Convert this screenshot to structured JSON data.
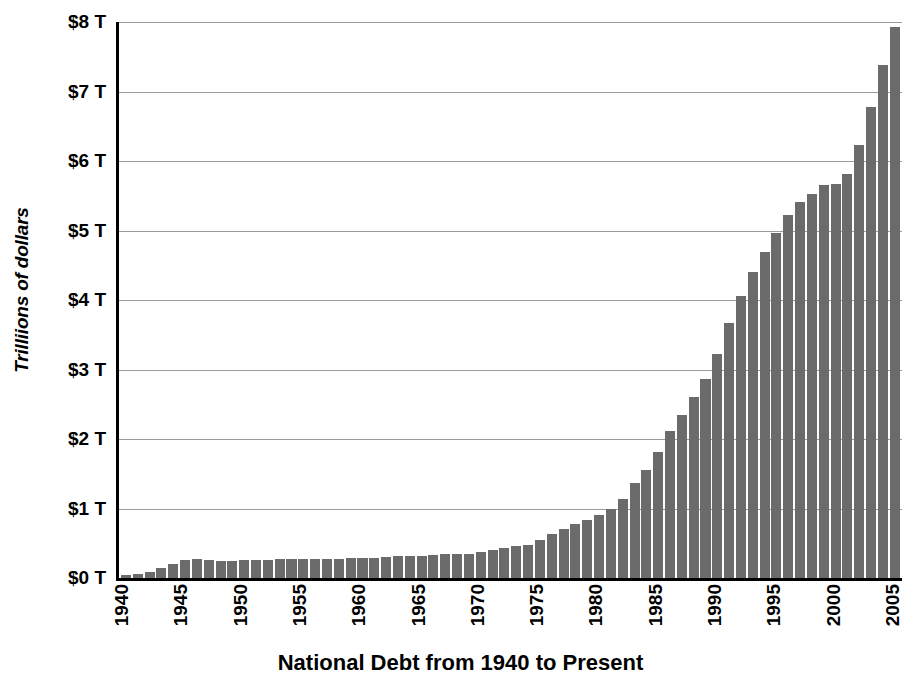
{
  "chart_data": {
    "type": "bar",
    "title": "National Debt from 1940 to Present",
    "xlabel": "",
    "ylabel": "Trilliions of dollars",
    "ylim": [
      0,
      8
    ],
    "ytick_labels": [
      "$8 T",
      "$7 T",
      "$6 T",
      "$5 T",
      "$4 T",
      "$3 T",
      "$2 T",
      "$1 T",
      "$0 T"
    ],
    "ytick_values": [
      8,
      7,
      6,
      5,
      4,
      3,
      2,
      1,
      0
    ],
    "xtick_labels": [
      "1940",
      "1945",
      "1950",
      "1955",
      "1960",
      "1965",
      "1970",
      "1975",
      "1980",
      "1985",
      "1990",
      "1995",
      "2000",
      "2005"
    ],
    "xtick_years": [
      1940,
      1945,
      1950,
      1955,
      1960,
      1965,
      1970,
      1975,
      1980,
      1985,
      1990,
      1995,
      2000,
      2005
    ],
    "grid": true,
    "legend": false,
    "bar_color": "#6b6b6b",
    "axis_color": "#000000",
    "gridline_color": "#9a9a9a",
    "categories": [
      1940,
      1941,
      1942,
      1943,
      1944,
      1945,
      1946,
      1947,
      1948,
      1949,
      1950,
      1951,
      1952,
      1953,
      1954,
      1955,
      1956,
      1957,
      1958,
      1959,
      1960,
      1961,
      1962,
      1963,
      1964,
      1965,
      1966,
      1967,
      1968,
      1969,
      1970,
      1971,
      1972,
      1973,
      1974,
      1975,
      1976,
      1977,
      1978,
      1979,
      1980,
      1981,
      1982,
      1983,
      1984,
      1985,
      1986,
      1987,
      1988,
      1989,
      1990,
      1991,
      1992,
      1993,
      1994,
      1995,
      1996,
      1997,
      1998,
      1999,
      2000,
      2001,
      2002,
      2003,
      2004,
      2005
    ],
    "values": [
      0.05,
      0.06,
      0.09,
      0.14,
      0.2,
      0.26,
      0.27,
      0.26,
      0.25,
      0.25,
      0.26,
      0.26,
      0.26,
      0.27,
      0.27,
      0.27,
      0.27,
      0.27,
      0.28,
      0.29,
      0.29,
      0.29,
      0.3,
      0.31,
      0.32,
      0.32,
      0.33,
      0.34,
      0.35,
      0.35,
      0.37,
      0.4,
      0.43,
      0.46,
      0.48,
      0.54,
      0.63,
      0.7,
      0.78,
      0.83,
      0.91,
      1.0,
      1.14,
      1.37,
      1.56,
      1.82,
      2.12,
      2.35,
      2.6,
      2.86,
      3.23,
      3.67,
      4.06,
      4.41,
      4.69,
      4.97,
      5.22,
      5.41,
      5.53,
      5.66,
      5.67,
      5.81,
      6.23,
      6.78,
      7.38,
      7.93
    ]
  }
}
